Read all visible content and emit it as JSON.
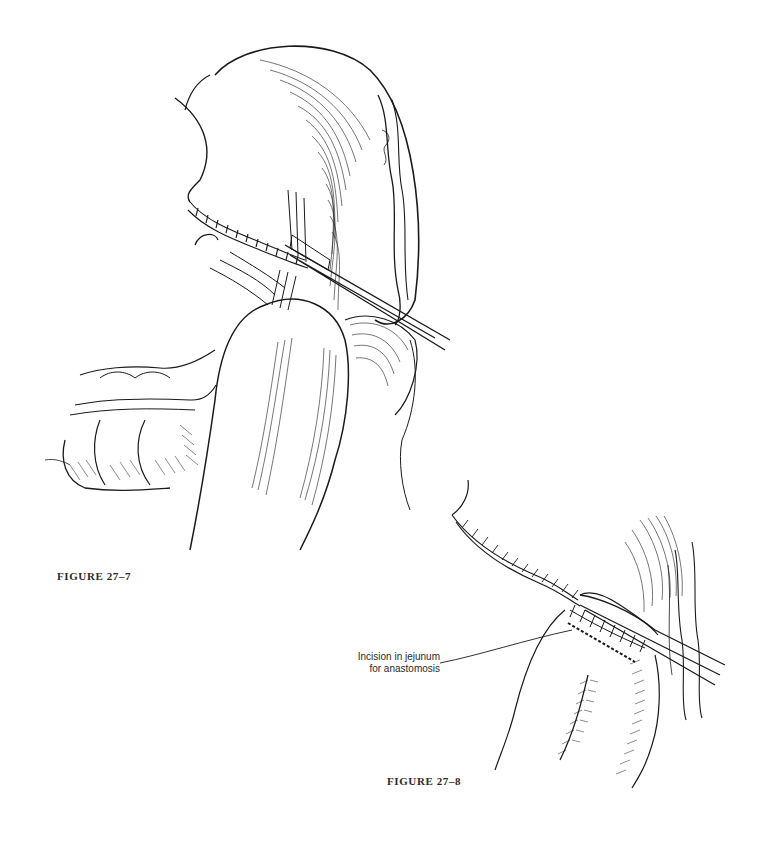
{
  "figures": [
    {
      "id": "27-7",
      "caption": "FIGURE 27–7",
      "illustration": "stomach-jejunum-clamp-sutures"
    },
    {
      "id": "27-8",
      "caption": "FIGURE 27–8",
      "illustration": "jejunum-incision-for-anastomosis",
      "annotation": {
        "line1": "Incision in jejunum",
        "line2": "for anastomosis"
      }
    }
  ],
  "colors": {
    "ink": "#1a1a1a",
    "background": "#ffffff"
  }
}
